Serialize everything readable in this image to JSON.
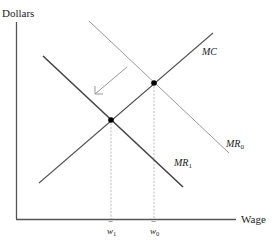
{
  "diagram": {
    "y_axis_label": "Dollars",
    "x_axis_label": "Wage",
    "curves": [
      {
        "name": "MC",
        "label": "MC",
        "sub": ""
      },
      {
        "name": "MR0",
        "label": "MR",
        "sub": "0"
      },
      {
        "name": "MR1",
        "label": "MR",
        "sub": "1"
      }
    ],
    "ticks": [
      {
        "label": "w",
        "bar": "¯",
        "sub": "1"
      },
      {
        "label": "w",
        "bar": "¯",
        "sub": "0"
      }
    ],
    "colors": {
      "axis": "#555555",
      "mc": "#555555",
      "mr0": "#999999",
      "mr1": "#444444",
      "arrow": "#999999",
      "dashed": "#aaaaaa",
      "point": "#000000"
    }
  }
}
